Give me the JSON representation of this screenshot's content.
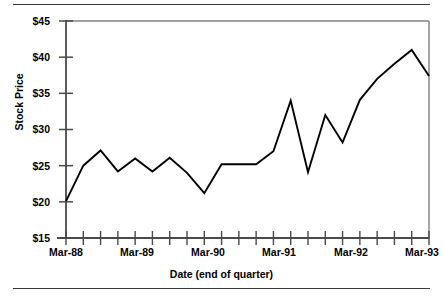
{
  "chart_data": {
    "type": "line",
    "title": "",
    "xlabel": "Date (end of quarter)",
    "ylabel": "Stock Price",
    "ylim": [
      15,
      45
    ],
    "ytick_labels": [
      "$45",
      "$40",
      "$35",
      "$30",
      "$25",
      "$20",
      "$15"
    ],
    "ytick_values": [
      45,
      40,
      35,
      30,
      25,
      20,
      15
    ],
    "xtick_labels": [
      "Mar-88",
      "Mar-89",
      "Mar-90",
      "Mar-91",
      "Mar-92",
      "Mar-93"
    ],
    "x": [
      "Mar-88",
      "Jun-88",
      "Sep-88",
      "Dec-88",
      "Mar-89",
      "Jun-89",
      "Sep-89",
      "Dec-89",
      "Mar-90",
      "Jun-90",
      "Sep-90",
      "Dec-90",
      "Mar-91",
      "Jun-91",
      "Sep-91",
      "Dec-91",
      "Mar-92",
      "Jun-92",
      "Sep-92",
      "Dec-92",
      "Mar-93",
      "Jun-93"
    ],
    "values": [
      20.1,
      25.0,
      27.1,
      24.2,
      26.0,
      24.2,
      26.1,
      24.0,
      21.2,
      25.2,
      25.2,
      25.2,
      27.0,
      34.0,
      24.1,
      32.0,
      28.2,
      34.1,
      37.0,
      39.1,
      41.0,
      37.4
    ],
    "grid": false,
    "legend": null,
    "line_color": "#000000",
    "axis_color": "#808080",
    "minor_ticks_per_major": 4
  }
}
